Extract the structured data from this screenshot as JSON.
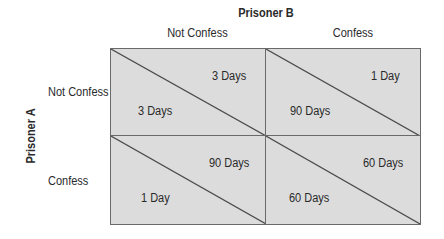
{
  "diagram": {
    "column_player": "Prisoner B",
    "row_player": "Prisoner A",
    "columns": [
      "Not Confess",
      "Confess"
    ],
    "rows": [
      "Not Confess",
      "Confess"
    ],
    "cells": [
      [
        {
          "a": "3 Days",
          "b": "3 Days"
        },
        {
          "a": "90 Days",
          "b": "1 Day"
        }
      ],
      [
        {
          "a": "1 Day",
          "b": "90 Days"
        },
        {
          "a": "60 Days",
          "b": "60 Days"
        }
      ]
    ],
    "colors": {
      "cell_fill": "#dcdcdc",
      "border": "#6a6a6a",
      "text": "#2a2a2a"
    }
  }
}
